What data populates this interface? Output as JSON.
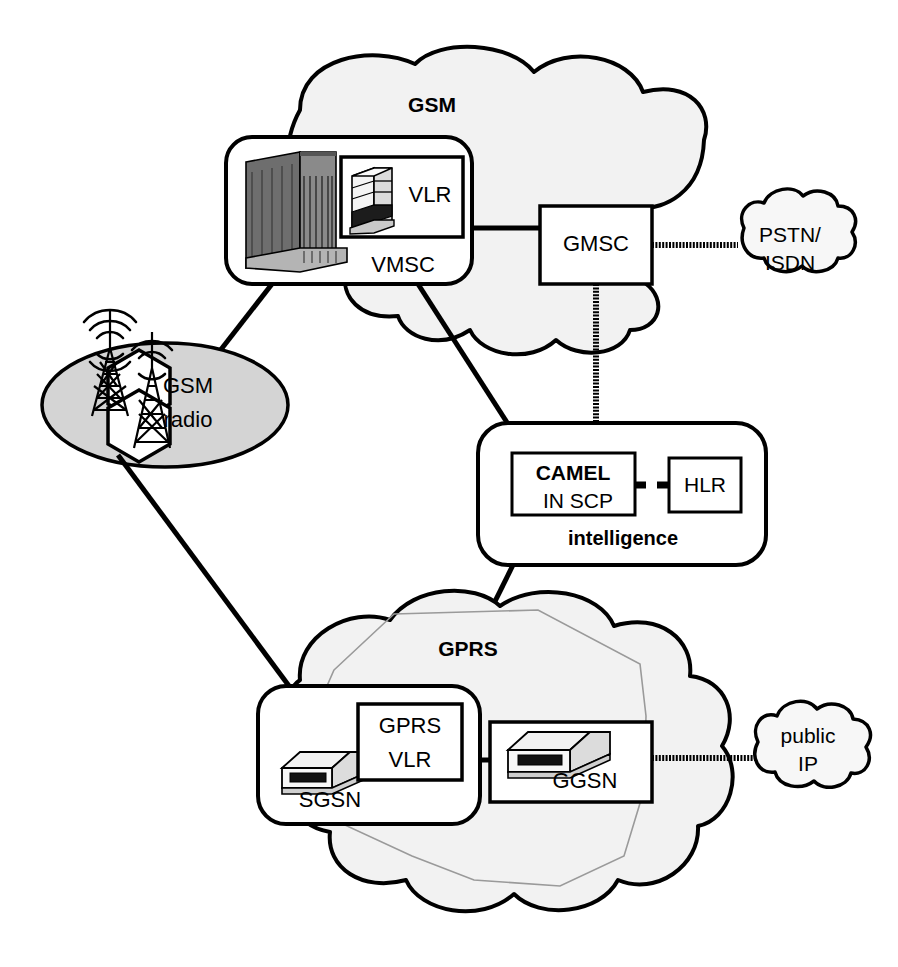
{
  "diagram": {
    "background": "#ffffff",
    "stroke_color": "#000000",
    "cloud_fill": "#f2f2f2",
    "radio_fill": "#d4d4d4",
    "inner_polygon_color": "#9a9a9a"
  },
  "clouds": [
    {
      "id": "gsm",
      "label": "GSM",
      "bold": true,
      "label_x": 432,
      "label_y": 106,
      "font_size": 21
    },
    {
      "id": "gprs",
      "label": "GPRS",
      "bold": true,
      "label_x": 468,
      "label_y": 650,
      "font_size": 21
    },
    {
      "id": "pstn",
      "label_line1": "PSTN/",
      "label_line2": "ISDN",
      "bold": false,
      "label_x": 786,
      "label_y": 236,
      "font_size": 21
    },
    {
      "id": "public",
      "label_line1": "public",
      "label_line2": "IP",
      "bold": false,
      "label_x": 800,
      "label_y": 737,
      "font_size": 21
    }
  ],
  "nodes": [
    {
      "id": "vmsc",
      "label": "VMSC",
      "label_x": 403,
      "label_y": 266,
      "font_size": 22,
      "bold": false,
      "shape": "rounded-box"
    },
    {
      "id": "vlr",
      "label": "VLR",
      "label_x": 430,
      "label_y": 196,
      "font_size": 22,
      "bold": false,
      "shape": "box"
    },
    {
      "id": "gmsc",
      "label": "GMSC",
      "label_x": 595,
      "label_y": 245,
      "font_size": 22,
      "bold": false,
      "shape": "box"
    },
    {
      "id": "camel",
      "label": "CAMEL",
      "label_x": 564,
      "label_y": 474,
      "font_size": 21,
      "bold": true,
      "shape": "box"
    },
    {
      "id": "in-scp",
      "label": "IN SCP",
      "label_x": 571,
      "label_y": 503,
      "font_size": 21,
      "bold": false,
      "shape": "box-label"
    },
    {
      "id": "hlr",
      "label": "HLR",
      "label_x": 700,
      "label_y": 488,
      "font_size": 21,
      "bold": false,
      "shape": "box"
    },
    {
      "id": "intelligence",
      "label": "intelligence",
      "label_x": 622,
      "label_y": 540,
      "font_size": 20,
      "bold": true,
      "shape": "rounded-box"
    },
    {
      "id": "sgsn",
      "label": "SGSN",
      "label_x": 330,
      "label_y": 799,
      "font_size": 22,
      "bold": false,
      "shape": "rounded-box"
    },
    {
      "id": "gprs-vlr-1",
      "label": "GPRS",
      "label_x": 407,
      "label_y": 726,
      "font_size": 22,
      "bold": false,
      "shape": "box"
    },
    {
      "id": "gprs-vlr-2",
      "label": "VLR",
      "label_x": 407,
      "label_y": 761,
      "font_size": 22,
      "bold": false,
      "shape": "box-label"
    },
    {
      "id": "ggsn",
      "label": "GGSN",
      "label_x": 583,
      "label_y": 779,
      "font_size": 22,
      "bold": false,
      "shape": "box"
    },
    {
      "id": "gsm-radio-1",
      "label": "GSM",
      "label_x": 187,
      "label_y": 387,
      "font_size": 22,
      "bold": false,
      "shape": "ellipse"
    },
    {
      "id": "gsm-radio-2",
      "label": "radio",
      "label_x": 188,
      "label_y": 421,
      "font_size": 22,
      "bold": false,
      "shape": "ellipse-label"
    }
  ],
  "icons": [
    {
      "id": "switch-cabinet-icon",
      "name": "msc-switch-cabinet",
      "inside": "vmsc"
    },
    {
      "id": "tower-server-icon",
      "name": "vlr-tower-server",
      "inside": "vlr"
    },
    {
      "id": "sgsn-server-icon",
      "name": "sgsn-rack-server",
      "inside": "sgsn"
    },
    {
      "id": "ggsn-server-icon",
      "name": "ggsn-rack-server",
      "inside": "ggsn"
    },
    {
      "id": "antenna-tower-1",
      "name": "cell-tower",
      "inside": "gsm-radio"
    },
    {
      "id": "antenna-tower-2",
      "name": "cell-tower",
      "inside": "gsm-radio"
    }
  ],
  "links": [
    {
      "id": "vmsc-gmsc",
      "from": "vmsc",
      "to": "gmsc",
      "style": "solid"
    },
    {
      "id": "gmsc-pstn",
      "from": "gmsc",
      "to": "pstn",
      "style": "hatched"
    },
    {
      "id": "gmsc-intelligence",
      "from": "gmsc",
      "to": "intelligence",
      "style": "hatched-vertical"
    },
    {
      "id": "vmsc-gsmradio",
      "from": "vmsc",
      "to": "gsm-radio",
      "style": "solid"
    },
    {
      "id": "vmsc-intelligence",
      "from": "vmsc",
      "to": "intelligence",
      "style": "solid"
    },
    {
      "id": "gsmradio-sgsn",
      "from": "gsm-radio",
      "to": "sgsn",
      "style": "solid"
    },
    {
      "id": "intelligence-sgsn",
      "from": "intelligence",
      "to": "sgsn",
      "style": "solid"
    },
    {
      "id": "sgsn-ggsn",
      "from": "sgsn",
      "to": "ggsn",
      "style": "solid"
    },
    {
      "id": "ggsn-publicip",
      "from": "ggsn",
      "to": "public",
      "style": "hatched"
    },
    {
      "id": "camel-hlr",
      "from": "camel",
      "to": "hlr",
      "style": "dashed"
    }
  ]
}
